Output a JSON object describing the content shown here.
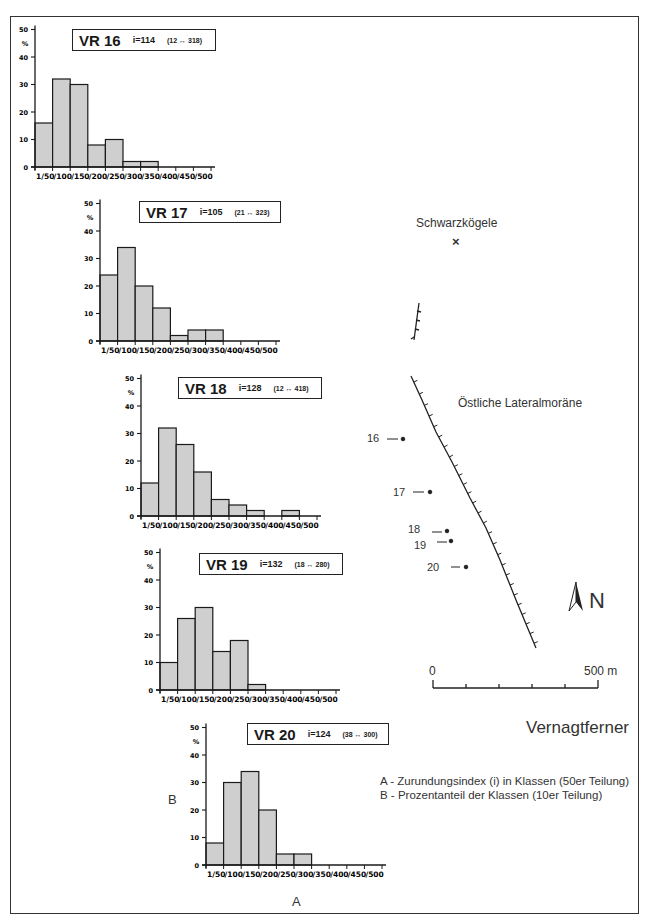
{
  "figure": {
    "axis_label_x": "A",
    "axis_label_y": "B",
    "legend": [
      "A - Zurundungsindex (i) in Klassen (50er Teilung)",
      "B - Prozentanteil der Klassen (10er Teilung)"
    ]
  },
  "map": {
    "peak_label": "Schwarzkögele",
    "peak_marker": "×",
    "moraine_label": "Östliche Lateralmoräne",
    "glacier_label": "Vernagtferner",
    "north_label": "N",
    "scale_start": "0",
    "scale_end": "500 m",
    "sites": [
      "16",
      "17",
      "18",
      "19",
      "20"
    ]
  },
  "chart_data": [
    {
      "type": "bar",
      "title": "VR 16",
      "index": "i=114",
      "range": "(12 ↔ 318)",
      "xlabel": "A",
      "ylabel": "%",
      "categories": [
        "1/50",
        "/100",
        "/150",
        "/200",
        "/250",
        "/300",
        "/350",
        "/400",
        "/450",
        "/500"
      ],
      "values": [
        16,
        32,
        30,
        8,
        10,
        2,
        2,
        0,
        0,
        0
      ],
      "ylim": [
        0,
        50
      ],
      "yticks": [
        "0",
        "10",
        "20",
        "30",
        "40",
        "50"
      ]
    },
    {
      "type": "bar",
      "title": "VR 17",
      "index": "i=105",
      "range": "(21 ↔ 323)",
      "xlabel": "A",
      "ylabel": "%",
      "categories": [
        "1/50",
        "/100",
        "/150",
        "/200",
        "/250",
        "/300",
        "/350",
        "/400",
        "/450",
        "/500"
      ],
      "values": [
        24,
        34,
        20,
        12,
        2,
        4,
        4,
        0,
        0,
        0
      ],
      "ylim": [
        0,
        50
      ],
      "yticks": [
        "0",
        "10",
        "20",
        "30",
        "40",
        "50"
      ]
    },
    {
      "type": "bar",
      "title": "VR 18",
      "index": "i=128",
      "range": "(12 ↔ 418)",
      "xlabel": "A",
      "ylabel": "%",
      "categories": [
        "1/50",
        "/100",
        "/150",
        "/200",
        "/250",
        "/300",
        "/350",
        "/400",
        "/450",
        "/500"
      ],
      "values": [
        12,
        32,
        26,
        16,
        6,
        4,
        2,
        0,
        2,
        0
      ],
      "ylim": [
        0,
        50
      ],
      "yticks": [
        "0",
        "10",
        "20",
        "30",
        "40",
        "50"
      ]
    },
    {
      "type": "bar",
      "title": "VR 19",
      "index": "i=132",
      "range": "(18 ↔ 280)",
      "xlabel": "A",
      "ylabel": "%",
      "categories": [
        "1/50",
        "/100",
        "/150",
        "/200",
        "/250",
        "/300",
        "/350",
        "/400",
        "/450",
        "/500"
      ],
      "values": [
        10,
        26,
        30,
        14,
        18,
        2,
        0,
        0,
        0,
        0
      ],
      "ylim": [
        0,
        50
      ],
      "yticks": [
        "0",
        "10",
        "20",
        "30",
        "40",
        "50"
      ]
    },
    {
      "type": "bar",
      "title": "VR 20",
      "index": "i=124",
      "range": "(38 ↔ 300)",
      "xlabel": "A",
      "ylabel": "%",
      "categories": [
        "1/50",
        "/100",
        "/150",
        "/200",
        "/250",
        "/300",
        "/350",
        "/400",
        "/450",
        "/500"
      ],
      "values": [
        8,
        30,
        34,
        20,
        4,
        4,
        0,
        0,
        0,
        0
      ],
      "ylim": [
        0,
        50
      ],
      "yticks": [
        "0",
        "10",
        "20",
        "30",
        "40",
        "50"
      ]
    }
  ]
}
